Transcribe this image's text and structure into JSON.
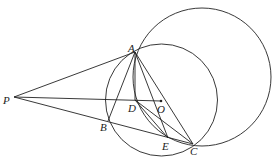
{
  "diagram": {
    "points": {
      "P": {
        "label": "P",
        "x": 14,
        "y": 97
      },
      "A": {
        "label": "A",
        "x": 135,
        "y": 52
      },
      "B": {
        "label": "B",
        "x": 108,
        "y": 121
      },
      "D": {
        "label": "D",
        "x": 135,
        "y": 100
      },
      "O": {
        "label": "O",
        "x": 161,
        "y": 101
      },
      "E": {
        "label": "E",
        "x": 168,
        "y": 138
      },
      "C": {
        "label": "C",
        "x": 193,
        "y": 144
      }
    },
    "circles": [
      {
        "name": "circle-O",
        "cx": 161.5,
        "cy": 100,
        "r": 56
      },
      {
        "name": "circle-large",
        "cx": 202,
        "cy": 77,
        "r": 69
      }
    ]
  }
}
